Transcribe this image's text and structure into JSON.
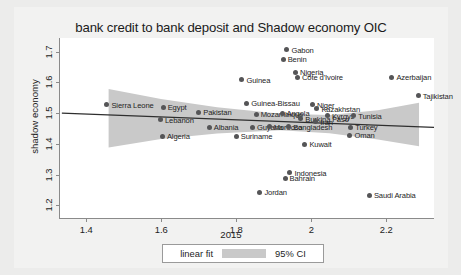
{
  "chart_data": {
    "type": "scatter",
    "title": "bank credit to bank deposit and Shadow economy OIC",
    "xlabel": "2015",
    "ylabel": "shadow economy",
    "xlim": [
      1.33,
      2.33
    ],
    "ylim": [
      1.155,
      1.745
    ],
    "xticks": [
      "1.4",
      "1.6",
      "1.8",
      "2",
      "2.2"
    ],
    "xtick_values": [
      1.4,
      1.6,
      1.8,
      2.0,
      2.2
    ],
    "yticks": [
      "1.2",
      "1.3",
      "1.4",
      "1.5",
      "1.6",
      "1.7"
    ],
    "ytick_values": [
      1.2,
      1.3,
      1.4,
      1.5,
      1.6,
      1.7
    ],
    "grid": false,
    "legend_position": "below-axis",
    "legend": [
      {
        "label": "linear fit",
        "type": "line",
        "color": "#3a3a3a"
      },
      {
        "label": "95% CI",
        "type": "band",
        "color": "#c9c9c9"
      }
    ],
    "fit_line": {
      "x": [
        1.335,
        2.33
      ],
      "y": [
        1.499,
        1.452
      ]
    },
    "ci_band": {
      "x": [
        1.46,
        1.6,
        1.75,
        1.92,
        2.05,
        2.18,
        2.29
      ],
      "upper": [
        1.578,
        1.545,
        1.518,
        1.497,
        1.493,
        1.508,
        1.533
      ],
      "lower": [
        1.386,
        1.414,
        1.432,
        1.443,
        1.433,
        1.412,
        1.39
      ]
    },
    "points": [
      {
        "label": "Gabon",
        "x": 1.935,
        "y": 1.706,
        "label_side": "right"
      },
      {
        "label": "Benin",
        "x": 1.925,
        "y": 1.676,
        "label_side": "right"
      },
      {
        "label": "Nigeria",
        "x": 1.958,
        "y": 1.634,
        "label_side": "right"
      },
      {
        "label": "Côte d'Ivoire",
        "x": 1.963,
        "y": 1.617,
        "label_side": "right"
      },
      {
        "label": "Guinea",
        "x": 1.815,
        "y": 1.609,
        "label_side": "right"
      },
      {
        "label": "Azerbaijan",
        "x": 2.215,
        "y": 1.617,
        "label_side": "right"
      },
      {
        "label": "Tajikistan",
        "x": 2.285,
        "y": 1.557,
        "label_side": "right"
      },
      {
        "label": "Guinea-Bissau",
        "x": 1.828,
        "y": 1.533,
        "label_side": "right"
      },
      {
        "label": "Sierra Leone",
        "x": 1.455,
        "y": 1.528,
        "label_side": "right"
      },
      {
        "label": "Egypt",
        "x": 1.605,
        "y": 1.519,
        "label_side": "right"
      },
      {
        "label": "Niger",
        "x": 2.003,
        "y": 1.528,
        "label_side": "right"
      },
      {
        "label": "Kazakhstan",
        "x": 2.015,
        "y": 1.514,
        "label_side": "right"
      },
      {
        "label": "Pakistan",
        "x": 1.7,
        "y": 1.503,
        "label_side": "right"
      },
      {
        "label": "Mozambique",
        "x": 1.853,
        "y": 1.497,
        "label_side": "right"
      },
      {
        "label": "Angola",
        "x": 1.922,
        "y": 1.5,
        "label_side": "right"
      },
      {
        "label": "Kyrgyz",
        "x": 2.043,
        "y": 1.492,
        "label_side": "right"
      },
      {
        "label": "Tunisia",
        "x": 2.113,
        "y": 1.492,
        "label_side": "right"
      },
      {
        "label": "Lebanon",
        "x": 1.598,
        "y": 1.478,
        "label_side": "right"
      },
      {
        "label": "Burkina Faso",
        "x": 1.972,
        "y": 1.481,
        "label_side": "right"
      },
      {
        "label": "Iran",
        "x": 2.012,
        "y": 1.472,
        "label_side": "right"
      },
      {
        "label": "Albania",
        "x": 1.728,
        "y": 1.454,
        "label_side": "right"
      },
      {
        "label": "Guyana",
        "x": 1.843,
        "y": 1.454,
        "label_side": "right"
      },
      {
        "label": "Morocco",
        "x": 1.888,
        "y": 1.456,
        "label_side": "right"
      },
      {
        "label": "Bangladesh",
        "x": 1.94,
        "y": 1.456,
        "label_side": "right"
      },
      {
        "label": "Turkey",
        "x": 2.105,
        "y": 1.454,
        "label_side": "right"
      },
      {
        "label": "Algeria",
        "x": 1.603,
        "y": 1.425,
        "label_side": "right"
      },
      {
        "label": "Suriname",
        "x": 1.8,
        "y": 1.425,
        "label_side": "right"
      },
      {
        "label": "Oman",
        "x": 2.103,
        "y": 1.428,
        "label_side": "right"
      },
      {
        "label": "Kuwait",
        "x": 1.983,
        "y": 1.398,
        "label_side": "right"
      },
      {
        "label": "Indonesia",
        "x": 1.943,
        "y": 1.305,
        "label_side": "right"
      },
      {
        "label": "Bahrain",
        "x": 1.93,
        "y": 1.288,
        "label_side": "right"
      },
      {
        "label": "Jordan",
        "x": 1.863,
        "y": 1.243,
        "label_side": "right"
      },
      {
        "label": "Saudi Arabia",
        "x": 2.155,
        "y": 1.233,
        "label_side": "right"
      }
    ]
  }
}
